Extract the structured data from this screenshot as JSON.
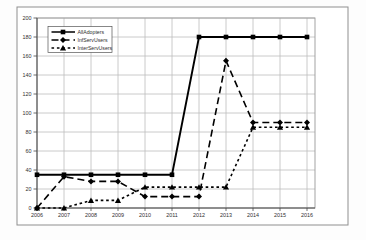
{
  "chart_data": {
    "type": "line",
    "x": [
      2006,
      2007,
      2008,
      2009,
      2010,
      2011,
      2012,
      2013,
      2014,
      2015,
      2016
    ],
    "series": [
      {
        "name": "AllAdopters",
        "values": [
          35,
          35,
          35,
          35,
          35,
          35,
          180,
          180,
          180,
          180,
          180
        ],
        "line": "solid",
        "marker": "square"
      },
      {
        "name": "InfServUsers",
        "values": [
          0,
          33,
          28,
          28,
          12,
          12,
          12,
          155,
          90,
          90,
          90
        ],
        "line": "long-dash",
        "marker": "diamond"
      },
      {
        "name": "InterServUsers",
        "values": [
          0,
          0,
          8,
          8,
          22,
          22,
          22,
          22,
          85,
          85,
          85
        ],
        "line": "short-dash",
        "marker": "triangle"
      }
    ],
    "title": "",
    "xlabel": "",
    "ylabel": "",
    "ylim": [
      0,
      200
    ],
    "ytick_step": 20,
    "yticks": [
      0,
      20,
      40,
      60,
      80,
      100,
      120,
      140,
      160,
      180,
      200
    ],
    "grid": true,
    "legend_position": "top-left",
    "colors": {
      "series": "#000000",
      "grid": "#bdbdbd",
      "plot_border": "#9a9a9a",
      "axis": "#4a4a4a",
      "text": "#2f2f2f",
      "background": "#ffffff",
      "frame_border": "#8f8f8f",
      "legend_bg": "#ffffff",
      "legend_border": "#555555"
    }
  }
}
